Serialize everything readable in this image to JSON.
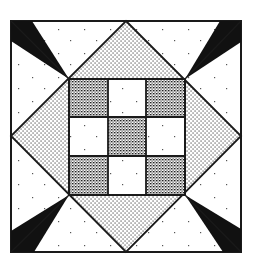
{
  "image": {
    "title": "Nine-patch quilt block",
    "description": "Quilt block: central nine-patch set on point inside a square, with dotted diamond triangles and black wedge accents at each corner"
  },
  "block": {
    "outer_square": {
      "x1": 11,
      "y1": 21,
      "x2": 241,
      "y2": 252
    },
    "nine_patch": {
      "x1": 69,
      "y1": 79,
      "x2": 185,
      "y2": 195,
      "rows": 3,
      "cols": 3
    },
    "nine_patch_pattern": [
      [
        "dark",
        "light",
        "dark"
      ],
      [
        "light",
        "dark",
        "light"
      ],
      [
        "dark",
        "light",
        "dark"
      ]
    ],
    "colors": {
      "outline": "#1a1a1a",
      "wedge": "#111111",
      "light": "#ffffff",
      "dark_fill": "#5a5a5a",
      "medium_fill": "#b0b0b0"
    }
  }
}
